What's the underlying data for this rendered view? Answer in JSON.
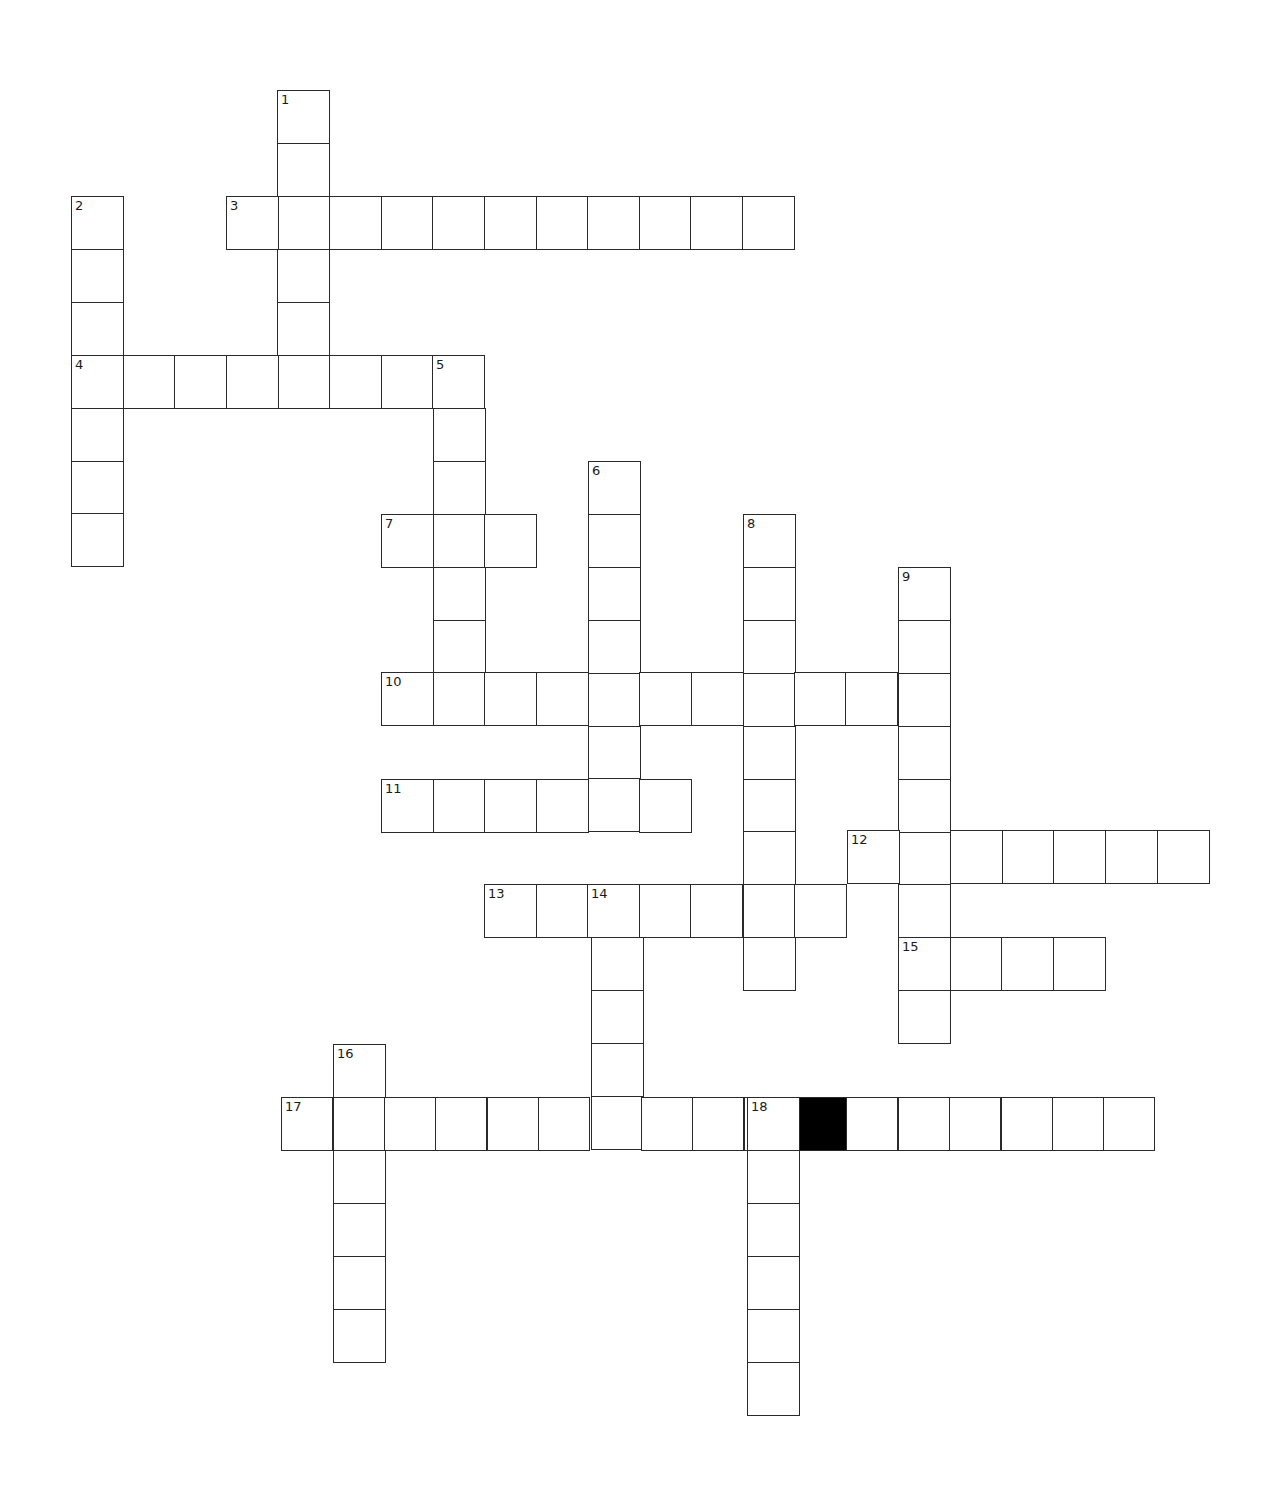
{
  "puzzle": {
    "type": "crossword",
    "colors": {
      "cell_border": "#2a2a2a",
      "cell_fill": "#ffffff",
      "block_fill": "#000000",
      "number_text": "#1a1a1a",
      "background": "#ffffff"
    },
    "cell_size": {
      "w": 51.6,
      "h": 52.9
    },
    "words": [
      {
        "number": "1",
        "direction": "down",
        "x": 277,
        "y": 90,
        "length": 6
      },
      {
        "number": "2",
        "direction": "down",
        "x": 71,
        "y": 196,
        "length": 7
      },
      {
        "number": "3",
        "direction": "across",
        "x": 226,
        "y": 196,
        "length": 11
      },
      {
        "number": "4",
        "direction": "across",
        "x": 71,
        "y": 355,
        "length": 8
      },
      {
        "number": "5",
        "direction": "down",
        "x": 433,
        "y": 355,
        "length": 7
      },
      {
        "number": "6",
        "direction": "down",
        "x": 588,
        "y": 461,
        "length": 7
      },
      {
        "number": "7",
        "direction": "across",
        "x": 381,
        "y": 514,
        "length": 3
      },
      {
        "number": "8",
        "direction": "down",
        "x": 743,
        "y": 514,
        "length": 9
      },
      {
        "number": "9",
        "direction": "down",
        "x": 898,
        "y": 567,
        "length": 9
      },
      {
        "number": "10",
        "direction": "across",
        "x": 381,
        "y": 672,
        "length": 11
      },
      {
        "number": "11",
        "direction": "across",
        "x": 381,
        "y": 779,
        "length": 6
      },
      {
        "number": "12",
        "direction": "across",
        "x": 847,
        "y": 830,
        "length": 7
      },
      {
        "number": "13",
        "direction": "across",
        "x": 484,
        "y": 884,
        "length": 7
      },
      {
        "number": "14",
        "direction": "down",
        "x": 591,
        "y": 884,
        "length": 5
      },
      {
        "number": "15",
        "direction": "across",
        "x": 898,
        "y": 937,
        "length": 4
      },
      {
        "number": "16",
        "direction": "down",
        "x": 333,
        "y": 1044,
        "length": 6
      },
      {
        "number": "17",
        "direction": "across",
        "x": 281,
        "y": 1097,
        "length": 17,
        "cell_w": 51.4,
        "blocks": [
          10
        ]
      },
      {
        "number": "18",
        "direction": "down",
        "x": 747,
        "y": 1097,
        "length": 6
      }
    ]
  }
}
